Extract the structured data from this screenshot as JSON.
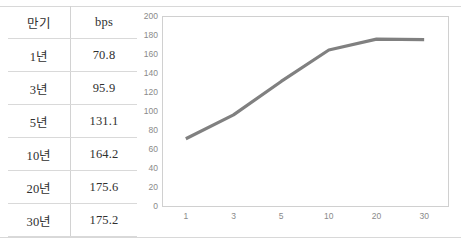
{
  "table": {
    "headers": [
      "만기",
      "bps"
    ],
    "rows": [
      {
        "maturity": "1년",
        "bps": "70.8"
      },
      {
        "maturity": "3년",
        "bps": "95.9"
      },
      {
        "maturity": "5년",
        "bps": "131.1"
      },
      {
        "maturity": "10년",
        "bps": "164.2"
      },
      {
        "maturity": "20년",
        "bps": "175.6"
      },
      {
        "maturity": "30년",
        "bps": "175.2"
      }
    ]
  },
  "chart_data": {
    "type": "line",
    "title": "",
    "xlabel": "",
    "ylabel": "",
    "categories": [
      "1",
      "3",
      "5",
      "10",
      "20",
      "30"
    ],
    "values": [
      70.8,
      95.9,
      131.1,
      164.2,
      175.6,
      175.2
    ],
    "series": [
      {
        "name": "bps",
        "values": [
          70.8,
          95.9,
          131.1,
          164.2,
          175.6,
          175.2
        ]
      }
    ],
    "ylim": [
      0,
      200
    ],
    "ytick_step": 20,
    "yticks": [
      "0",
      "20",
      "40",
      "60",
      "80",
      "100",
      "120",
      "140",
      "160",
      "180",
      "200"
    ],
    "xticks": [
      "1",
      "3",
      "5",
      "10",
      "20",
      "30"
    ],
    "grid": "horizontal",
    "legend": "none",
    "line_color": "#808080",
    "gridline_color": "#d9d9d9",
    "frame_color": "#d0d0d0",
    "tick_label_color": "#8a8a8a"
  }
}
